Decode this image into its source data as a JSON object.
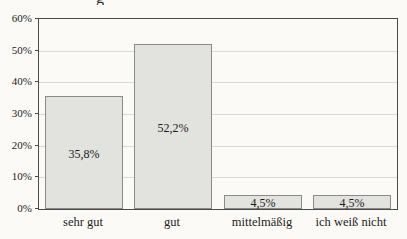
{
  "title_fragment": "g",
  "chart_data": {
    "type": "bar",
    "categories": [
      "sehr gut",
      "gut",
      "mittelmäßig",
      "ich weiß nicht"
    ],
    "values": [
      35.8,
      52.2,
      4.5,
      4.5
    ],
    "value_labels": [
      "35,8%",
      "52,2%",
      "4,5%",
      "4,5%"
    ],
    "title": "",
    "xlabel": "",
    "ylabel": "",
    "ylim": [
      0,
      60
    ],
    "ytick_step": 10,
    "ytick_labels": [
      "0%",
      "10%",
      "20%",
      "30%",
      "40%",
      "50%",
      "60%"
    ],
    "grid": "horizontal-faint",
    "legend": "none",
    "bar_value_label_position": "center"
  },
  "colors": {
    "background": "#fbfaf7",
    "bar_fill": "#e2e2df",
    "bar_border": "#8a8a86",
    "plot_border": "#4a4a48",
    "gridline": "#dbd9d4",
    "text": "#1c1c1a"
  }
}
